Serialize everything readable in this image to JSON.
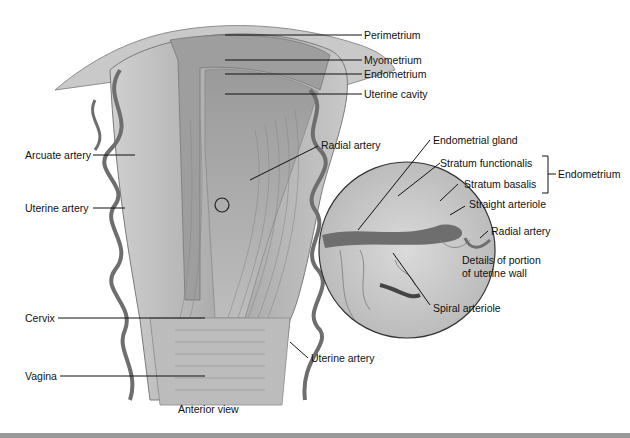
{
  "diagram": {
    "title": "Anterior view",
    "colors": {
      "tissue": "#b5b5b5",
      "tissue_dark": "#8a8a8a",
      "vessel": "#6e6e6e",
      "line": "#111111",
      "background": "#ffffff"
    },
    "labels_right_top": [
      {
        "id": "perimetrium",
        "text": "Perimetrium"
      },
      {
        "id": "myometrium",
        "text": "Myometrium"
      },
      {
        "id": "endometrium",
        "text": "Endometrium"
      },
      {
        "id": "uterine_cavity",
        "text": "Uterine cavity"
      }
    ],
    "labels_left": [
      {
        "id": "arcuate_artery",
        "text": "Arcuate artery"
      },
      {
        "id": "uterine_artery_left",
        "text": "Uterine artery"
      },
      {
        "id": "cervix",
        "text": "Cervix"
      },
      {
        "id": "vagina",
        "text": "Vagina"
      }
    ],
    "labels_middle": [
      {
        "id": "radial_artery",
        "text": "Radial artery"
      },
      {
        "id": "uterine_artery_right",
        "text": "Uterine artery"
      }
    ],
    "inset": {
      "caption_line1": "Details of portion",
      "caption_line2": "of uterine wall",
      "labels": [
        {
          "id": "endometrial_gland",
          "text": "Endometrial gland"
        },
        {
          "id": "stratum_functionalis",
          "text": "Stratum functionalis"
        },
        {
          "id": "stratum_basalis",
          "text": "Stratum basalis"
        },
        {
          "id": "straight_arteriole",
          "text": "Straight arteriole"
        },
        {
          "id": "radial_artery_inset",
          "text": "Radial artery"
        },
        {
          "id": "spiral_arteriole",
          "text": "Spiral arteriole"
        }
      ],
      "bracket_label": "Endometrium"
    },
    "view_caption": "Anterior view"
  }
}
